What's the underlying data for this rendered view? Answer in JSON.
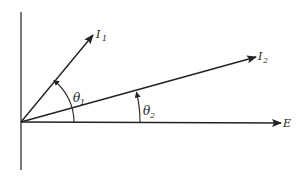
{
  "diagram": {
    "type": "phasor-diagram",
    "phasors": [
      {
        "name": "I1",
        "label": "I",
        "subscript": "1"
      },
      {
        "name": "I2",
        "label": "I",
        "subscript": "2"
      },
      {
        "name": "E",
        "label": "E",
        "subscript": ""
      }
    ],
    "angles": [
      {
        "name": "theta1",
        "label": "θ",
        "subscript": "1",
        "between": [
          "E",
          "I1"
        ]
      },
      {
        "name": "theta2",
        "label": "θ",
        "subscript": "2",
        "between": [
          "E",
          "I2"
        ]
      }
    ],
    "colors": {
      "line": "#222222",
      "background": "#ffffff"
    }
  }
}
